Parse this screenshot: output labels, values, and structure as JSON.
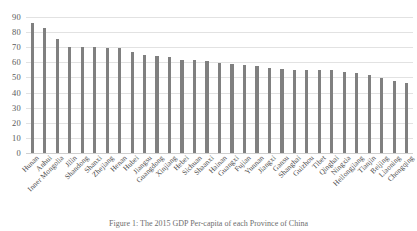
{
  "chart_data": {
    "type": "bar",
    "title": "",
    "caption": "Figure 1: The 2015 GDP Per-capita of each Province of China",
    "xlabel": "",
    "ylabel": "",
    "ylim": [
      0,
      90
    ],
    "yticks": [
      0,
      10,
      20,
      30,
      40,
      50,
      60,
      70,
      80,
      90
    ],
    "grid": true,
    "legend": "none",
    "bar_color": "#808080",
    "gridline_color": "#e2e2e2",
    "categories": [
      "Hunan",
      "Anhui",
      "Inner Mongolia",
      "Jilin",
      "Shandong",
      "Shanxi",
      "Zhejiang",
      "Henan",
      "Hubei",
      "Jiangsu",
      "Guangdong",
      "Xinjiang",
      "Hebei",
      "Sichuan",
      "Shaanxi",
      "Hainan",
      "Guangxi",
      "Fujian",
      "Yunnan",
      "Jiangxi",
      "Gansu",
      "Shanghai",
      "Guizhou",
      "Tibet",
      "Qinghai",
      "Ningxia",
      "Heilongjiang",
      "Tianjin",
      "Beijing",
      "Liaoning",
      "Chongqing"
    ],
    "values": [
      86.0,
      82.5,
      75.5,
      70.3,
      70.3,
      70.3,
      69.8,
      69.8,
      66.7,
      65.0,
      64.5,
      63.7,
      61.3,
      61.3,
      61.0,
      59.5,
      59.0,
      58.3,
      57.5,
      56.5,
      55.5,
      55.0,
      55.0,
      55.0,
      55.0,
      53.5,
      53.0,
      51.5,
      49.5,
      47.5,
      46.5
    ]
  }
}
